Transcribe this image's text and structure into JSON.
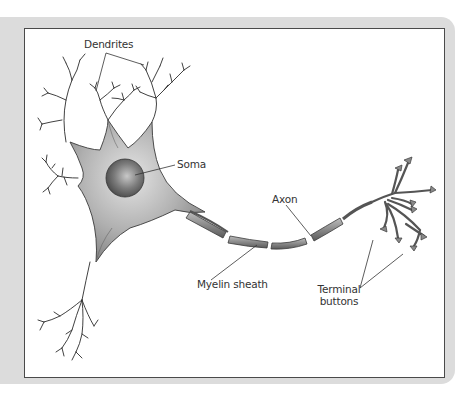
{
  "diagram": {
    "colors": {
      "frame": "#dcdcdc",
      "panel": "#ffffff",
      "panel_border": "#4a4a4a",
      "cell_body": "#9a9a9a",
      "nucleus": "#6e6e6e",
      "line": "#333333"
    },
    "labels": {
      "dendrites": "Dendrites",
      "soma": "Soma",
      "axon": "Axon",
      "myelin_sheath": "Myelin sheath",
      "terminal_buttons_line1": "Terminal",
      "terminal_buttons_line2": "buttons"
    },
    "parts": [
      "Dendrites",
      "Soma",
      "Axon",
      "Myelin sheath",
      "Terminal buttons"
    ]
  }
}
